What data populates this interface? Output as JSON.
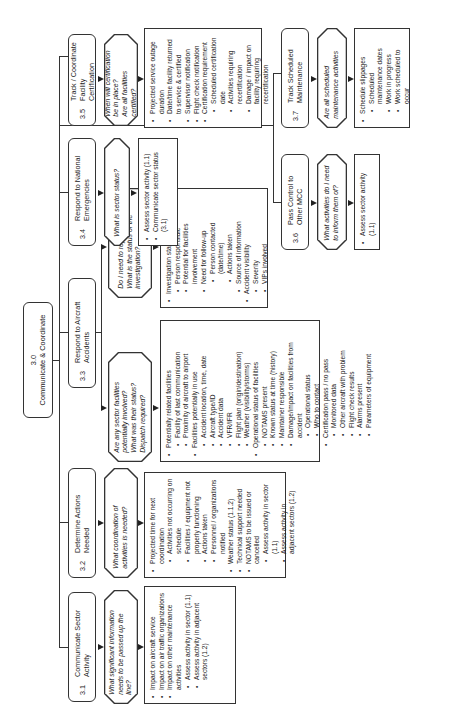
{
  "root": {
    "number": "3.0",
    "title": "Communicate & Coordinate"
  },
  "tasks": [
    {
      "id": "3.1",
      "number": "3.1",
      "title": "Communicate Sector Activity",
      "questions": [
        "What significant information needs to be passed up the line?"
      ],
      "items": [
        {
          "text": "Impact on aircraft service"
        },
        {
          "text": "Impact on air traffic organizations"
        },
        {
          "text": "Impact on other maintenance activities",
          "children": [
            {
              "text": "Assess activity in sector (1.1)"
            },
            {
              "text": "Assess activity in adjacent sectors (1.2)"
            }
          ]
        }
      ]
    },
    {
      "id": "3.2",
      "number": "3.2",
      "title": "Determine Actions Needed",
      "questions": [
        "What coordination of activities is needed?"
      ],
      "items": [
        {
          "text": "Projected time for next coordination",
          "children": [
            {
              "text": "Activities not occurring on schedule"
            },
            {
              "text": "Facilities / equipment not properly functioning"
            },
            {
              "text": "Actions taken"
            },
            {
              "text": "Personnel / organizations notified"
            }
          ]
        },
        {
          "text": "Weather status (1.1.2)"
        },
        {
          "text": "Technical support needed"
        },
        {
          "text": "NOTAMS to be issued or cancelled",
          "children": [
            {
              "text": "Assess activity in sector (1.1)"
            },
            {
              "text": "Assess activity in adjacent sectors (1.2)"
            }
          ]
        }
      ]
    },
    {
      "id": "3.3",
      "number": "3.3",
      "title": "Respond to Aircraft Accidents",
      "branches": [
        {
          "questions": [
            "Are any sector facilities potentially involved?",
            "What was their status?",
            "Dispatch required?"
          ],
          "items": [
            {
              "text": "Potentially related facilities",
              "children": [
                {
                  "text": "Facility of last communication"
                },
                {
                  "text": "Proximity of aircraft to airport"
                }
              ]
            },
            {
              "text": "Facilities potentially in use",
              "children": [
                {
                  "text": "Accident location, time, date"
                },
                {
                  "text": "Aircraft type/ID"
                },
                {
                  "text": "Accident data"
                },
                {
                  "text": "VFR/IFR"
                },
                {
                  "text": "Flight plan (origin/destination)"
                },
                {
                  "text": "Weather (visibility/storms)"
                }
              ]
            },
            {
              "text": "Operational status of facilities",
              "children": [
                {
                  "text": "NOTAMS present"
                },
                {
                  "text": "Known status at time (history)"
                },
                {
                  "text": "Maintainer responsible"
                },
                {
                  "text": "Damage/impact on facilities from accident",
                  "children": [
                    {
                      "text": "Operational status"
                    },
                    {
                      "text": "Who to contact"
                    }
                  ]
                },
                {
                  "text": "Certification pass / no pass",
                  "children": [
                    {
                      "text": "Monitored data"
                    },
                    {
                      "text": "Other aircraft with problem"
                    },
                    {
                      "text": "Flight check results"
                    },
                    {
                      "text": "Alarms present"
                    },
                    {
                      "text": "Parameters of equipment"
                    }
                  ]
                }
              ]
            }
          ]
        },
        {
          "questions": [
            "Do I need to report it up line?",
            "What is the status of the investigation?"
          ],
          "items": [
            {
              "text": "Investigation status",
              "children": [
                {
                  "text": "Person responsible"
                },
                {
                  "text": "Potential for facilities involvement"
                },
                {
                  "text": "Need for follow-up",
                  "children": [
                    {
                      "text": "Person contacted (date/time)"
                    },
                    {
                      "text": "Actions taken"
                    }
                  ]
                },
                {
                  "text": "Source of information"
                }
              ]
            },
            {
              "text": "Accident visibility",
              "children": [
                {
                  "text": "Severity"
                },
                {
                  "text": "VIPs involved"
                }
              ]
            }
          ]
        }
      ]
    },
    {
      "id": "3.4",
      "number": "3.4",
      "title": "Respond to National Emergencies",
      "questions": [
        "What is sector status?"
      ],
      "items": [
        {
          "text": "Assess sector activity (1.1)"
        },
        {
          "text": "Communicate sector status (3.1)"
        }
      ]
    },
    {
      "id": "3.5",
      "number": "3.5",
      "title": "Track / Coordinate Facility Certification",
      "questions": [
        "When will certification be in place?",
        "Are all facilities certified?"
      ],
      "items": [
        {
          "text": "Projected service outage duration"
        },
        {
          "text": "Date/time facility returned to service & certified"
        },
        {
          "text": "Supervisor notification"
        },
        {
          "text": "Flight check notification"
        },
        {
          "text": "Certification requirement",
          "children": [
            {
              "text": "Scheduled certification date"
            },
            {
              "text": "Activities requiring recertification"
            },
            {
              "text": "Damage / impact on facility requiring recertification"
            }
          ]
        }
      ]
    },
    {
      "id": "3.6",
      "number": "3.6",
      "title": "Pass Control to Other MCC",
      "questions": [
        "What activities do I need to inform them of?"
      ],
      "items": [
        {
          "text": "Assess sector activity (1.1)"
        }
      ]
    },
    {
      "id": "3.7",
      "number": "3.7",
      "title": "Track Scheduled Maintenance",
      "questions": [
        "Are all scheduled maintenance activities"
      ],
      "items": [
        {
          "text": "Schedule slippages",
          "children": [
            {
              "text": "Scheduled maintenance dates"
            },
            {
              "text": "Work in progress"
            },
            {
              "text": "Work scheduled to occur"
            }
          ]
        }
      ]
    }
  ]
}
